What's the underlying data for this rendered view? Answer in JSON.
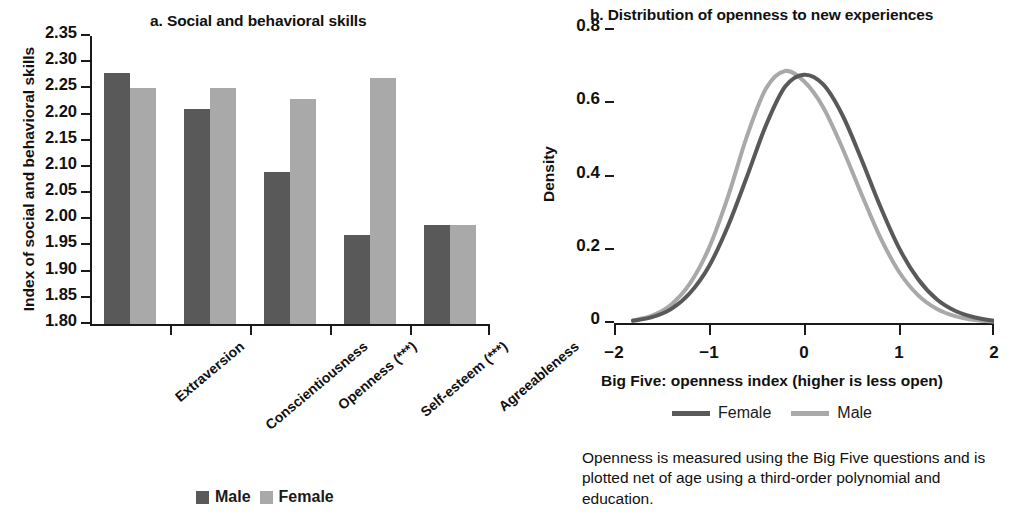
{
  "panel_a": {
    "title": "a. Social and behavioral skills",
    "ylabel": "Index of social and behavioral skills",
    "legend": [
      {
        "label": "Male",
        "color": "#595959"
      },
      {
        "label": "Female",
        "color": "#a9a9a9"
      }
    ]
  },
  "panel_b": {
    "title": "b. Distribution of openness to new experiences",
    "ylabel": "Density",
    "xlabel": "Big Five: openness index (higher is less open)",
    "legend": [
      {
        "label": "Female",
        "color": "#595959"
      },
      {
        "label": "Male",
        "color": "#a9a9a9"
      }
    ],
    "note": "Openness is measured using the Big Five questions and is plotted net of age using a third-order polynomial and education."
  },
  "colors": {
    "male_bar": "#595959",
    "female_bar": "#a9a9a9",
    "female_line": "#595959",
    "male_line": "#a9a9a9",
    "axis": "#1a1a1a",
    "text": "#111111"
  },
  "chart_data": [
    {
      "type": "bar",
      "title": "a. Social and behavioral skills",
      "xlabel": "",
      "ylabel": "Index of social and behavioral skills",
      "categories": [
        "Extraversion",
        "Conscientiousness",
        "Openness (***)",
        "Self-esteem (***)",
        "Agreeableness"
      ],
      "series": [
        {
          "name": "Male",
          "values": [
            2.28,
            2.21,
            2.09,
            1.97,
            1.99
          ]
        },
        {
          "name": "Female",
          "values": [
            2.25,
            2.25,
            2.23,
            2.27,
            1.99
          ]
        }
      ],
      "ylim": [
        1.8,
        2.35
      ],
      "yticks": [
        1.8,
        1.85,
        1.9,
        1.95,
        2.0,
        2.05,
        2.1,
        2.15,
        2.2,
        2.25,
        2.3,
        2.35
      ],
      "ytick_labels": [
        "1.80",
        "1.85",
        "1.90",
        "1.95",
        "2.00",
        "2.05",
        "2.10",
        "2.15",
        "2.20",
        "2.25",
        "2.30",
        "2.35"
      ],
      "grid": false,
      "legend_position": "bottom"
    },
    {
      "type": "line",
      "title": "b. Distribution of openness to new experiences",
      "xlabel": "Big Five: openness index (higher is less open)",
      "ylabel": "Density",
      "xlim": [
        -2,
        2
      ],
      "ylim": [
        0,
        0.8
      ],
      "xticks": [
        -2,
        -1,
        0,
        1,
        2
      ],
      "xtick_labels": [
        "−2",
        "−1",
        "0",
        "1",
        "2"
      ],
      "yticks": [
        0,
        0.2,
        0.4,
        0.6,
        0.8
      ],
      "ytick_labels": [
        "0",
        "0.2",
        "0.4",
        "0.6",
        "0.8"
      ],
      "grid": false,
      "legend_position": "bottom",
      "series": [
        {
          "name": "Female",
          "color": "#595959",
          "x": [
            -1.8,
            -1.6,
            -1.4,
            -1.2,
            -1.0,
            -0.8,
            -0.6,
            -0.4,
            -0.2,
            0.0,
            0.2,
            0.4,
            0.6,
            0.8,
            1.0,
            1.2,
            1.4,
            1.6,
            1.8,
            2.0
          ],
          "y": [
            0.006,
            0.016,
            0.038,
            0.082,
            0.155,
            0.265,
            0.4,
            0.54,
            0.645,
            0.678,
            0.652,
            0.57,
            0.45,
            0.32,
            0.205,
            0.12,
            0.064,
            0.032,
            0.015,
            0.006
          ]
        },
        {
          "name": "Male",
          "color": "#a9a9a9",
          "x": [
            -1.8,
            -1.6,
            -1.4,
            -1.2,
            -1.0,
            -0.8,
            -0.6,
            -0.4,
            -0.2,
            0.0,
            0.2,
            0.4,
            0.6,
            0.8,
            1.0,
            1.2,
            1.4,
            1.6,
            1.8,
            2.0
          ],
          "y": [
            0.007,
            0.02,
            0.05,
            0.108,
            0.205,
            0.345,
            0.51,
            0.64,
            0.688,
            0.66,
            0.59,
            0.48,
            0.355,
            0.235,
            0.14,
            0.076,
            0.038,
            0.018,
            0.008,
            0.004
          ]
        }
      ]
    }
  ]
}
